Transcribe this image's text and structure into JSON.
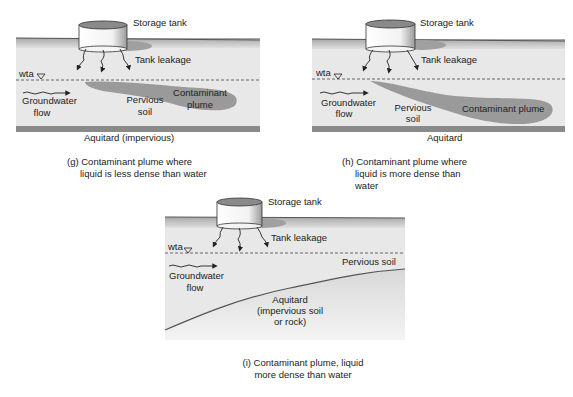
{
  "panels": [
    {
      "id": "g",
      "storage_tank": "Storage tank",
      "tank_leakage": "Tank leakage",
      "water_table": "wta",
      "groundwater": [
        "Groundwater",
        "flow"
      ],
      "pervious_soil": [
        "Pervious",
        "soil"
      ],
      "plume": [
        "Contaminant",
        "plume"
      ],
      "aquitard": "Aquitard (impervious)",
      "caption": [
        "(g) Contaminant plume where",
        "liquid is less dense than water"
      ]
    },
    {
      "id": "h",
      "storage_tank": "Storage tank",
      "tank_leakage": "Tank leakage",
      "water_table": "wta",
      "groundwater": [
        "Groundwater",
        "flow"
      ],
      "pervious_soil": [
        "Pervious",
        "soil"
      ],
      "plume": [
        "Contaminant plume"
      ],
      "aquitard": "Aquitard",
      "caption": [
        "(h) Contaminant plume where",
        "liquid is more dense than",
        "water"
      ]
    },
    {
      "id": "i",
      "storage_tank": "Storage tank",
      "tank_leakage": "Tank leakage",
      "water_table": "wta",
      "groundwater": [
        "Groundwater",
        "flow"
      ],
      "pervious_soil": [
        "Pervious soil"
      ],
      "aquitard": [
        "Aquitard",
        "(impervious soil",
        "or rock)"
      ],
      "caption": [
        "(i) Contaminant plume, liquid",
        "more dense than water"
      ]
    }
  ],
  "colors": {
    "ground_top": "#c8c8c8",
    "soil": "#e6e6e6",
    "plume": "#9a9a9a",
    "line": "#333333"
  }
}
